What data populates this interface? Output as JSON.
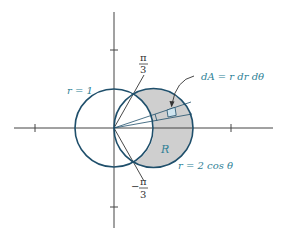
{
  "figure": {
    "labels": {
      "circle_unit": "r = 1",
      "circle_cos": "r = 2 cos θ",
      "area_element": "dA = r dr dθ",
      "region": "R",
      "angle_top_num": "π",
      "angle_top_den": "3",
      "angle_bottom_sign": "−",
      "angle_bottom_num": "π",
      "angle_bottom_den": "3"
    },
    "colors": {
      "curve": "#1f4f6b",
      "label": "#2e7f96",
      "shade": "#cfcfcf",
      "element": "#cfe4ef",
      "axis": "#444444"
    }
  }
}
